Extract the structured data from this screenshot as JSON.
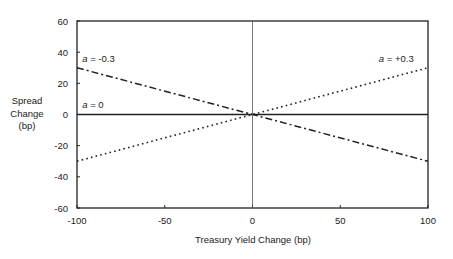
{
  "chart_data": {
    "type": "line",
    "title": "",
    "xlabel": "Treasury Yield Change (bp)",
    "ylabel": [
      "Spread",
      "Change",
      "(bp)"
    ],
    "xlim": [
      -100,
      100
    ],
    "ylim": [
      -60,
      60
    ],
    "xticks": [
      -100,
      -50,
      0,
      50,
      100
    ],
    "yticks": [
      60,
      40,
      20,
      0,
      -20,
      -40,
      -60
    ],
    "grid": false,
    "series": [
      {
        "name": "a = -0.3",
        "style": "dash-dot",
        "x": [
          -100,
          100
        ],
        "y": [
          30,
          -30
        ]
      },
      {
        "name": "a = 0",
        "style": "solid",
        "x": [
          -100,
          100
        ],
        "y": [
          0,
          0
        ]
      },
      {
        "name": "a = +0.3",
        "style": "dotted",
        "x": [
          -100,
          100
        ],
        "y": [
          -30,
          30
        ]
      }
    ],
    "annotations": [
      {
        "text": "a = -0.3",
        "var": "a",
        "rest": " = -0.3",
        "x": -97,
        "y": 34
      },
      {
        "text": "a = 0",
        "var": "a",
        "rest": " = 0",
        "x": -97,
        "y": 4
      },
      {
        "text": "a = +0.3",
        "var": "a",
        "rest": " = +0.3",
        "x": 72,
        "y": 34
      }
    ]
  }
}
